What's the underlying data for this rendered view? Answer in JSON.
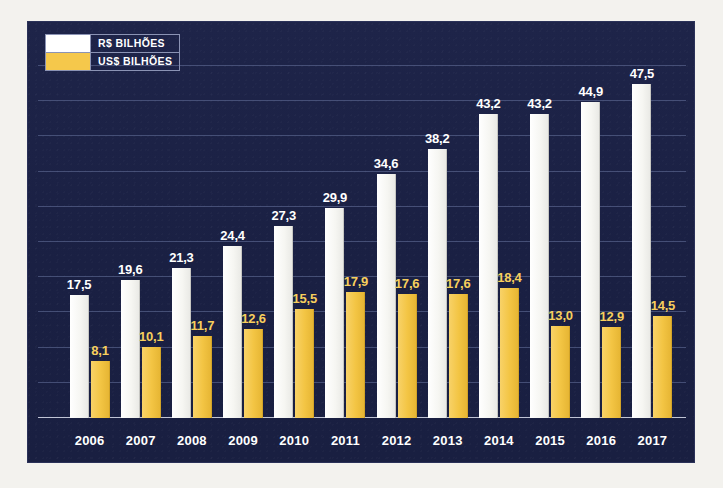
{
  "chart_data": {
    "type": "bar",
    "title": "",
    "xlabel": "",
    "ylabel": "",
    "categories": [
      "2006",
      "2007",
      "2008",
      "2009",
      "2010",
      "2011",
      "2012",
      "2013",
      "2014",
      "2015",
      "2016",
      "2017"
    ],
    "series": [
      {
        "name": "R$ BILHÕES",
        "color": "#ffffff",
        "values": [
          17.5,
          19.6,
          21.3,
          24.4,
          27.3,
          29.9,
          34.6,
          38.2,
          43.2,
          43.2,
          44.9,
          47.5
        ],
        "labels": [
          "17,5",
          "19,6",
          "21,3",
          "24,4",
          "27,3",
          "29,9",
          "34,6",
          "38,2",
          "43,2",
          "43,2",
          "44,9",
          "47,5"
        ]
      },
      {
        "name": "US$ BILHÕES",
        "color": "#f5c84b",
        "values": [
          8.1,
          10.1,
          11.7,
          12.6,
          15.5,
          17.9,
          17.6,
          17.6,
          18.4,
          13.0,
          12.9,
          14.5
        ],
        "labels": [
          "8,1",
          "10,1",
          "11,7",
          "12,6",
          "15,5",
          "17,9",
          "17,6",
          "17,6",
          "18,4",
          "13,0",
          "12,9",
          "14,5"
        ]
      }
    ],
    "ylim": [
      0,
      50
    ],
    "grid": true,
    "gridline_step": 5,
    "legend_position": "top-left",
    "background_color": "#1c2247"
  },
  "legend": {
    "rows": [
      {
        "label": "R$ BILHÕES",
        "swatch": "#ffffff"
      },
      {
        "label": "US$ BILHÕES",
        "swatch": "#f5c84b"
      }
    ]
  }
}
